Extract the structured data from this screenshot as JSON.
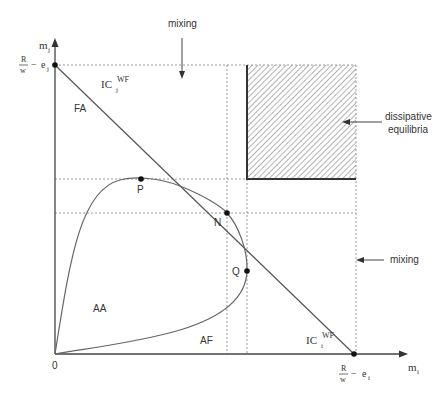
{
  "diagram": {
    "axes": {
      "y_label": "m",
      "y_label_sub": "j",
      "x_label": "m",
      "x_label_sub": "i",
      "origin_label": "0",
      "y_intercept_label": {
        "num": "R",
        "den": "w",
        "minus": "−",
        "var": "e",
        "sub": "j"
      },
      "x_intercept_label": {
        "num": "R",
        "den": "w",
        "minus": "−",
        "var": "e",
        "sub": "i"
      }
    },
    "curves": {
      "ic_j": {
        "base": "IC",
        "sub": "j",
        "sup": "WF"
      },
      "ic_i": {
        "base": "IC",
        "sub": "i",
        "sup": "WF"
      }
    },
    "points": {
      "P": "P",
      "N": "N",
      "Q": "Q"
    },
    "regions": {
      "FA": "FA",
      "AA": "AA",
      "AF": "AF"
    },
    "annotations": {
      "mixing_top": "mixing",
      "mixing_right": "mixing",
      "dissipative_line1": "dissipative",
      "dissipative_line2": "equilibria"
    },
    "colors": {
      "line": "#555555",
      "axis": "#444444",
      "dotted": "#999999",
      "hatch": "#888888",
      "point": "#111111"
    }
  }
}
